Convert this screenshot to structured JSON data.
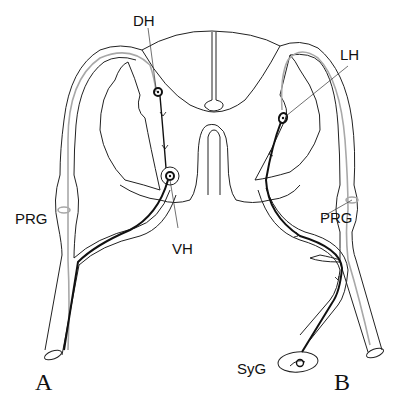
{
  "diagram": {
    "type": "anatomical schematic",
    "labels": {
      "dorsal_horn": "DH",
      "ventral_horn": "VH",
      "lateral_horn": "LH",
      "posterior_root_ganglion_left": "PRG",
      "posterior_root_ganglion_right": "PRG",
      "sympathetic_ganglion": "SyG",
      "panel_a": "A",
      "panel_b": "B"
    },
    "panels": [
      {
        "id": "A",
        "description": "Somatic pathway: afferent fiber via PRG to DH neuron, down to VH motor neuron, efferent out ventral root"
      },
      {
        "id": "B",
        "description": "Autonomic pathway: afferent via PRG to LH neuron, preganglionic fiber exits to SyG"
      }
    ],
    "colors": {
      "outline": "#222222",
      "afferent_fiber": "#a8a8a8",
      "neuron_path": "#111111",
      "background": "#ffffff"
    }
  }
}
